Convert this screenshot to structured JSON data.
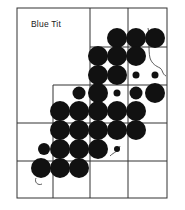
{
  "map": {
    "title": "Blue Tit",
    "colors": {
      "ink": "#111111",
      "paper": "#ffffff",
      "grid": "#333333"
    },
    "frame": {
      "x": 17,
      "y": 8,
      "w": 150,
      "h": 190
    },
    "dots": [
      {
        "x": 117,
        "y": 38,
        "r": 10
      },
      {
        "x": 136,
        "y": 38,
        "r": 10
      },
      {
        "x": 155,
        "y": 38,
        "r": 10
      },
      {
        "x": 98,
        "y": 56,
        "r": 10
      },
      {
        "x": 117,
        "y": 56,
        "r": 10
      },
      {
        "x": 136,
        "y": 56,
        "r": 10
      },
      {
        "x": 98,
        "y": 75,
        "r": 10
      },
      {
        "x": 117,
        "y": 75,
        "r": 10
      },
      {
        "x": 136,
        "y": 75,
        "r": 3.5
      },
      {
        "x": 155,
        "y": 75,
        "r": 3.5
      },
      {
        "x": 79,
        "y": 93,
        "r": 6.5
      },
      {
        "x": 98,
        "y": 93,
        "r": 10
      },
      {
        "x": 117,
        "y": 93,
        "r": 3.5
      },
      {
        "x": 136,
        "y": 93,
        "r": 6.5
      },
      {
        "x": 155,
        "y": 93,
        "r": 10
      },
      {
        "x": 60,
        "y": 111,
        "r": 10
      },
      {
        "x": 79,
        "y": 111,
        "r": 10
      },
      {
        "x": 98,
        "y": 111,
        "r": 10
      },
      {
        "x": 117,
        "y": 111,
        "r": 10
      },
      {
        "x": 136,
        "y": 111,
        "r": 10
      },
      {
        "x": 60,
        "y": 130,
        "r": 10
      },
      {
        "x": 79,
        "y": 130,
        "r": 10
      },
      {
        "x": 98,
        "y": 130,
        "r": 10
      },
      {
        "x": 117,
        "y": 130,
        "r": 10
      },
      {
        "x": 136,
        "y": 130,
        "r": 10
      },
      {
        "x": 44,
        "y": 149,
        "r": 6
      },
      {
        "x": 60,
        "y": 149,
        "r": 10
      },
      {
        "x": 79,
        "y": 149,
        "r": 10
      },
      {
        "x": 98,
        "y": 149,
        "r": 10
      },
      {
        "x": 117,
        "y": 149,
        "r": 3
      },
      {
        "x": 41,
        "y": 168,
        "r": 10
      },
      {
        "x": 60,
        "y": 168,
        "r": 10
      },
      {
        "x": 79,
        "y": 168,
        "r": 10
      }
    ]
  }
}
